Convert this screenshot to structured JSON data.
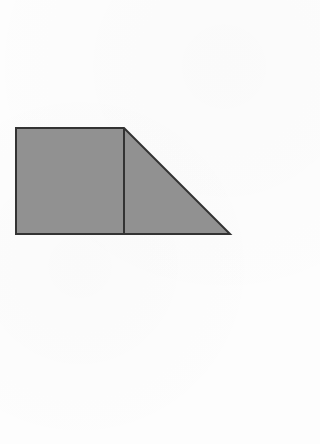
{
  "figure": {
    "background_color": "#fdfdfd",
    "fill_color": "#919191",
    "stroke_color": "#333333",
    "stroke_width": "2",
    "canvas": {
      "width": "320",
      "height": "444"
    },
    "outline_points": "16,128 124,128 230,234 16,234",
    "divider": {
      "x1": "124",
      "y1": "128",
      "x2": "124",
      "y2": "234"
    }
  }
}
